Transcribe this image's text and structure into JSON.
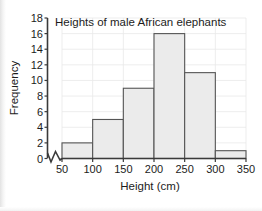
{
  "chart_data": {
    "type": "bar",
    "title": "Heights of male African elephants",
    "xlabel": "Height (cm)",
    "ylabel": "Frequency",
    "categories": [
      "50-100",
      "100-150",
      "150-200",
      "200-250",
      "250-300",
      "300-350"
    ],
    "bin_edges": [
      50,
      100,
      150,
      200,
      250,
      300,
      350
    ],
    "values": [
      2,
      5,
      9,
      16,
      11,
      1
    ],
    "xlim": [
      50,
      350
    ],
    "ylim": [
      0,
      18
    ],
    "x_ticks": [
      "50",
      "100",
      "150",
      "200",
      "250",
      "300",
      "350"
    ],
    "y_ticks": [
      "0",
      "2",
      "4",
      "6",
      "8",
      "10",
      "12",
      "14",
      "16",
      "18"
    ],
    "grid": true,
    "legend": false,
    "axis_break": "x-axis break between 0 and 50",
    "bar_fill_color": "#ebebeb",
    "bar_edge_color": "#555555",
    "grid_color": "#e8e8e8",
    "axis_color": "#3a3a3a"
  }
}
